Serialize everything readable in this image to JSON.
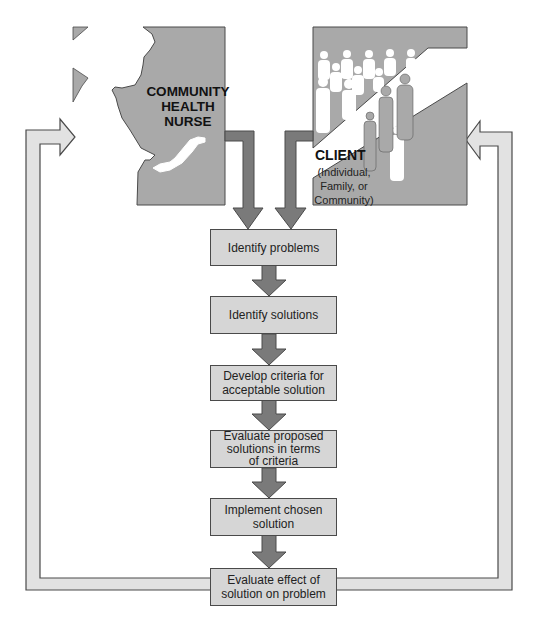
{
  "actors": {
    "nurse": {
      "label_lines": [
        "COMMUNITY",
        "HEALTH",
        "NURSE"
      ]
    },
    "client": {
      "title": "CLIENT",
      "sub_lines": [
        "(Individual,",
        "Family, or",
        "Community)"
      ]
    }
  },
  "steps": [
    {
      "lines": [
        "Identify problems"
      ]
    },
    {
      "lines": [
        "Identify solutions"
      ]
    },
    {
      "lines": [
        "Develop criteria for",
        "acceptable solution"
      ]
    },
    {
      "lines": [
        "Evaluate proposed",
        "solutions in terms",
        "of criteria"
      ]
    },
    {
      "lines": [
        "Implement chosen",
        "solution"
      ]
    },
    {
      "lines": [
        "Evaluate effect of",
        "solution on problem"
      ]
    }
  ],
  "colors": {
    "panel_gray": "#a9a9a9",
    "box_fill": "#d6d6d6",
    "arrow_dark": "#7a7a7a",
    "feedback_arrow": "#e2e2e2",
    "outline": "#4a4a4a"
  }
}
